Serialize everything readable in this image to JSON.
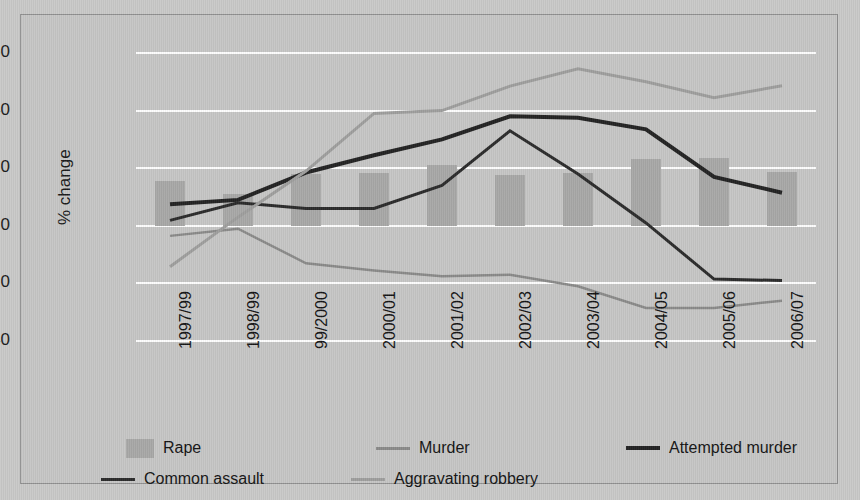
{
  "chart_data": {
    "type": "bar",
    "title": "",
    "subtitle": "",
    "xlabel": "",
    "ylabel": "% change",
    "ylim": [
      -40,
      60
    ],
    "yticks": [
      60,
      40,
      20,
      0,
      -20,
      -40
    ],
    "ytick_labels": [
      "60",
      "40",
      "20",
      "0",
      "–20",
      "–40"
    ],
    "grid": true,
    "legend_position": "bottom",
    "categories": [
      "1997/99",
      "1998/99",
      "99/2000",
      "2000/01",
      "2001/02",
      "2002/03",
      "2003/04",
      "2004/05",
      "2005/06",
      "2006/07"
    ],
    "series": [
      {
        "name": "Rape",
        "type": "bar",
        "color": "#a8a8a7",
        "values": [
          15.7,
          10.9,
          17.9,
          18.4,
          21.1,
          17.6,
          18.3,
          23.1,
          23.6,
          18.8
        ]
      },
      {
        "name": "Murder",
        "type": "line",
        "color": "#8a8a89",
        "width": 2.5,
        "values": [
          -3.5,
          -1.0,
          -13.0,
          -15.5,
          -17.5,
          -17.0,
          -21.0,
          -28.5,
          -28.5,
          -26.0
        ]
      },
      {
        "name": "Attempted murder",
        "type": "line",
        "color": "#232323",
        "width": 4,
        "values": [
          7.5,
          9.0,
          18.5,
          24.5,
          30.0,
          38.0,
          37.5,
          33.5,
          17.0,
          11.5
        ]
      },
      {
        "name": "Common assault",
        "type": "line",
        "color": "#2b2b2b",
        "width": 3,
        "values": [
          1.9,
          8.0,
          6.0,
          6.0,
          14.0,
          33.0,
          18.0,
          1.0,
          -18.5,
          -19.0
        ]
      },
      {
        "name": "Aggravating robbery",
        "type": "line",
        "color": "#9e9e9d",
        "width": 3,
        "values": [
          -14.2,
          3.0,
          19.0,
          39.0,
          40.0,
          48.5,
          54.5,
          50.0,
          44.5,
          48.6
        ]
      }
    ]
  },
  "legend": {
    "items": [
      {
        "label": "Rape",
        "marker": "box",
        "color": "#a8a8a7"
      },
      {
        "label": "Murder",
        "marker": "line",
        "color": "#8a8a89"
      },
      {
        "label": "Attempted murder",
        "marker": "line-thick",
        "color": "#232323"
      },
      {
        "label": "Common assault",
        "marker": "line",
        "color": "#2b2b2b"
      },
      {
        "label": "Aggravating robbery",
        "marker": "line",
        "color": "#9e9e9d"
      }
    ]
  }
}
